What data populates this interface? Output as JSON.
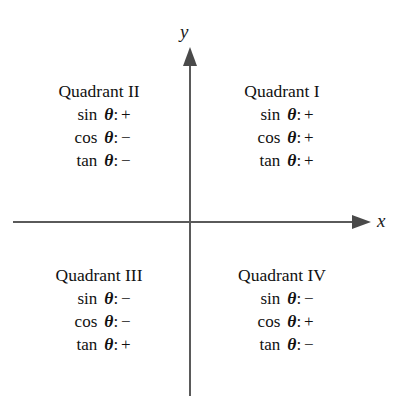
{
  "figure": {
    "axes": {
      "x_label": "x",
      "y_label": "y",
      "axis_color": "#5a5a5a",
      "arrow_color": "#4a4a4a"
    },
    "background_color": "#ffffff",
    "text_color": "#111111",
    "theta_symbol": "θ",
    "colon": ":",
    "plus_sign": "+",
    "minus_sign": "−"
  },
  "quadrants": [
    {
      "id": "quadrant-1",
      "title": "Quadrant I",
      "rows": [
        {
          "function": "sin",
          "symbol": "θ",
          "separator": ":",
          "sign": "+"
        },
        {
          "function": "cos",
          "symbol": "θ",
          "separator": ":",
          "sign": "+"
        },
        {
          "function": "tan",
          "symbol": "θ",
          "separator": ":",
          "sign": "+"
        }
      ]
    },
    {
      "id": "quadrant-2",
      "title": "Quadrant II",
      "rows": [
        {
          "function": "sin",
          "symbol": "θ",
          "separator": ":",
          "sign": "+"
        },
        {
          "function": "cos",
          "symbol": "θ",
          "separator": ":",
          "sign": "−"
        },
        {
          "function": "tan",
          "symbol": "θ",
          "separator": ":",
          "sign": "−"
        }
      ]
    },
    {
      "id": "quadrant-3",
      "title": "Quadrant III",
      "rows": [
        {
          "function": "sin",
          "symbol": "θ",
          "separator": ":",
          "sign": "−"
        },
        {
          "function": "cos",
          "symbol": "θ",
          "separator": ":",
          "sign": "−"
        },
        {
          "function": "tan",
          "symbol": "θ",
          "separator": ":",
          "sign": "+"
        }
      ]
    },
    {
      "id": "quadrant-4",
      "title": "Quadrant IV",
      "rows": [
        {
          "function": "sin",
          "symbol": "θ",
          "separator": ":",
          "sign": "−"
        },
        {
          "function": "cos",
          "symbol": "θ",
          "separator": ":",
          "sign": "+"
        },
        {
          "function": "tan",
          "symbol": "θ",
          "separator": ":",
          "sign": "−"
        }
      ]
    }
  ]
}
